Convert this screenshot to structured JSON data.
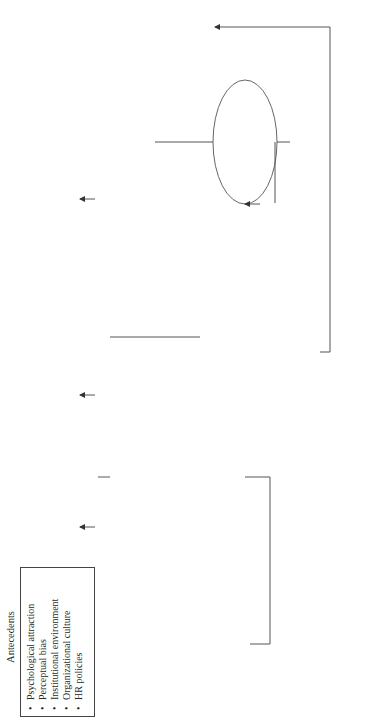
{
  "stages": {
    "antecedents": {
      "title": "Antecedents",
      "items": [
        "Psychological attraction",
        "Perceptual bias",
        "Institutional environment",
        "Organizational culture",
        "HR policies"
      ]
    },
    "level_of_fit": {
      "title": "Level of Fit*",
      "items": [
        "P-S-F",
        "P-G-F",
        "P-O-F",
        "G-O-F",
        "O-E-F"
      ]
    },
    "stage1": {
      "title": "Stage I:",
      "subtitle": "Affective Outcomes",
      "items": [
        "Satisfaction",
        "Cohesion",
        "Harmony",
        "Positive identity",
        "Efficacy",
        "Low Emotional/Relationship Conflict"
      ]
    },
    "stage2": {
      "title": "Stage II:",
      "subtitle": "Cognitive Outcomes",
      "items": [
        "Inertia",
        "Status quo",
        "Groupthink",
        "Selective awareness",
        "Low knowledge diversity",
        "Low Task Conflict"
      ]
    },
    "stage3": {
      "title": "Stage III:",
      "subtitle": "Behavioral Outcomes",
      "items": [
        "Low learning",
        "Low creativity",
        "Inferior decisions",
        "Reduced network ties",
        "Sub par performance"
      ]
    },
    "stage4": {
      "title": "Stage IV:",
      "subtitle": "Survival Outcomes",
      "items": [
        "Individual exit",
        "Team disbandment",
        "Firm failure"
      ]
    }
  },
  "feedback": {
    "line1": "Disequilibrium",
    "line2": "Negative feedback"
  },
  "adaptive": {
    "title": "Adaptive responses",
    "items": [
      "Habitual",
      "Mimetic",
      "Creative"
    ]
  },
  "non_adaptive": {
    "title": "Non-adaptive responses",
    "items": [
      "Defensive",
      "Non-response"
    ]
  },
  "footnote": {
    "star": "* Refers to demographic similarity between the various levels",
    "defs": [
      "P-S-F = Person-Supervisor Fit",
      "P-G-F = Person-Group Fit",
      "P-O-F = Person-Organization Fit",
      "G-O-F = Group-Organization Fit",
      "O-E-F = Organization-Environment Fit"
    ]
  }
}
